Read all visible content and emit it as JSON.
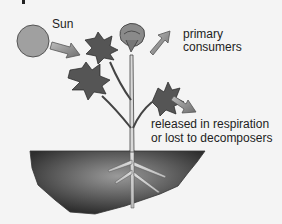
{
  "diagram": {
    "labels": {
      "sun": "Sun",
      "primary_consumers_line1": "primary",
      "primary_consumers_line2": "consumers",
      "released_line1": "released in respiration",
      "released_line2": "or lost to decomposers"
    },
    "colors": {
      "sun_fill": "#a0a0a0",
      "arrow_fill": "#8a8a8a",
      "leaf_fill": "#555555",
      "soil_dark": "#2e2e2e",
      "soil_light": "#9a9a9a",
      "background": "#f4f4f4"
    }
  }
}
